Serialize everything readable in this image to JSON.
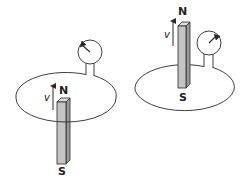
{
  "figure": {
    "colors": {
      "line": "#2a2a2a",
      "magnet_front": "#c4c4c4",
      "magnet_side": "#9a9a9a",
      "magnet_top": "#dcdcdc"
    },
    "panels": [
      {
        "id": "left",
        "caption": "Magnet below loop, N pole entering loop",
        "north_label": "N",
        "south_label": "S",
        "velocity_label": "v",
        "meter_needle": "deflected-left"
      },
      {
        "id": "right",
        "caption": "Magnet above loop, S pole leaving loop",
        "north_label": "N",
        "south_label": "S",
        "velocity_label": "v",
        "meter_needle": "deflected-right"
      }
    ]
  }
}
